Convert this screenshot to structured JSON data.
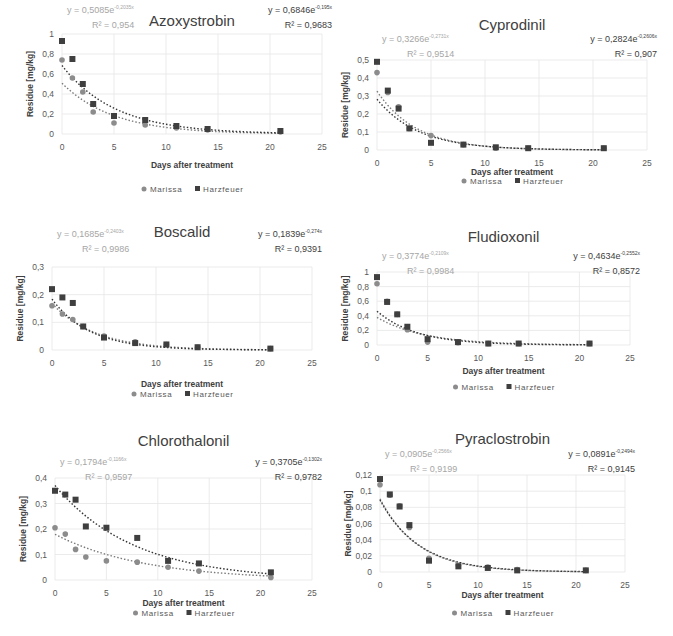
{
  "common": {
    "xlabel": "Days after treatment",
    "ylabel": "Residue [mg/kg]",
    "legend": [
      "Marissa",
      "Harzfeuer"
    ],
    "colors": {
      "Marissa": "#8c8c8c",
      "Harzfeuer": "#3f3f3f",
      "grid": "#e6e6e6",
      "text": "#404040",
      "eq_marissa": "#a6a6a6"
    }
  },
  "chart_data": [
    {
      "type": "scatter",
      "title": "Azoxystrobin",
      "xlabel": "Days after treatment",
      "ylabel": "Residue [mg/kg]",
      "xlim": [
        0,
        25
      ],
      "ylim": [
        0,
        1
      ],
      "xticks": [
        "0",
        "5",
        "10",
        "15",
        "20",
        "25"
      ],
      "yticks": [
        "0",
        "0,2",
        "0,4",
        "0,6",
        "0,8",
        "1"
      ],
      "x": [
        0,
        1,
        2,
        3,
        5,
        8,
        11,
        14,
        21
      ],
      "series": [
        {
          "name": "Marissa",
          "values": [
            0.74,
            0.56,
            0.42,
            0.22,
            0.11,
            0.09,
            0.06,
            0.04,
            0.02
          ],
          "fit": {
            "a": 0.5085,
            "b": 0.2035,
            "equation": "y = 0,5085e",
            "exponent": "-0,2035x",
            "r2": "R² = 0,954"
          }
        },
        {
          "name": "Harzfeuer",
          "values": [
            0.93,
            0.75,
            0.5,
            0.3,
            0.18,
            0.14,
            0.08,
            0.05,
            0.03
          ],
          "fit": {
            "a": 0.6846,
            "b": 0.195,
            "equation": "y = 0,6846e",
            "exponent": "-0,195x",
            "r2": "R² = 0,9683"
          }
        }
      ],
      "legend_position": "bottom",
      "grid": true
    },
    {
      "type": "scatter",
      "title": "Cyprodinil",
      "xlabel": "Days after treatment",
      "ylabel": "Residue [mg/kg]",
      "xlim": [
        0,
        25
      ],
      "ylim": [
        0,
        0.5
      ],
      "xticks": [
        "0",
        "5",
        "10",
        "15",
        "20",
        "25"
      ],
      "yticks": [
        "0",
        "0,1",
        "0,2",
        "0,3",
        "0,4",
        "0,5"
      ],
      "x": [
        0,
        1,
        2,
        3,
        5,
        8,
        11,
        14,
        21
      ],
      "series": [
        {
          "name": "Marissa",
          "values": [
            0.43,
            0.32,
            0.24,
            0.12,
            0.08,
            0.03,
            0.01,
            0.01,
            0.01
          ],
          "fit": {
            "a": 0.3266,
            "b": 0.2731,
            "equation": "y = 0,3266e",
            "exponent": "-0,2731x",
            "r2": "R² = 0,9514"
          }
        },
        {
          "name": "Harzfeuer",
          "values": [
            0.49,
            0.33,
            0.23,
            0.12,
            0.04,
            0.03,
            0.015,
            0.01,
            0.01
          ],
          "fit": {
            "a": 0.2824,
            "b": 0.2606,
            "equation": "y = 0,2824e",
            "exponent": "-0,2606x",
            "r2": "R² = 0,907"
          }
        }
      ],
      "legend_position": "bottom",
      "grid": true
    },
    {
      "type": "scatter",
      "title": "Boscalid",
      "xlabel": "Days after treatment",
      "ylabel": "Residue [mg/kg]",
      "xlim": [
        0,
        25
      ],
      "ylim": [
        0,
        0.3
      ],
      "xticks": [
        "0",
        "5",
        "10",
        "15",
        "20",
        "25"
      ],
      "yticks": [
        "0",
        "0,1",
        "0,2",
        "0,3"
      ],
      "x": [
        0,
        1,
        2,
        3,
        5,
        8,
        11,
        14,
        21
      ],
      "series": [
        {
          "name": "Marissa",
          "values": [
            0.16,
            0.13,
            0.11,
            0.085,
            0.05,
            0.03,
            0.02,
            0.01,
            0.005
          ],
          "fit": {
            "a": 0.1685,
            "b": 0.2403,
            "equation": "y = 0,1685e",
            "exponent": "-0,2403x",
            "r2": "R² = 0,9986"
          }
        },
        {
          "name": "Harzfeuer",
          "values": [
            0.22,
            0.19,
            0.17,
            0.085,
            0.045,
            0.025,
            0.02,
            0.01,
            0.005
          ],
          "fit": {
            "a": 0.1839,
            "b": 0.274,
            "equation": "y = 0,1839e",
            "exponent": "-0,274x",
            "r2": "R² = 0,9391"
          }
        }
      ],
      "legend_position": "bottom",
      "grid": true
    },
    {
      "type": "scatter",
      "title": "Fludioxonil",
      "xlabel": "Days after treatment",
      "ylabel": "Residue [mg/kg]",
      "xlim": [
        0,
        25
      ],
      "ylim": [
        0,
        1
      ],
      "xticks": [
        "0",
        "5",
        "10",
        "15",
        "20",
        "25"
      ],
      "yticks": [
        "0",
        "0,2",
        "0,4",
        "0,6",
        "0,8",
        "1"
      ],
      "x": [
        0,
        1,
        2,
        3,
        5,
        8,
        11,
        14,
        21
      ],
      "series": [
        {
          "name": "Marissa",
          "values": [
            0.84,
            0.6,
            0.42,
            0.21,
            0.04,
            0.03,
            0.02,
            0.02,
            0.02
          ],
          "fit": {
            "a": 0.3774,
            "b": 0.2109,
            "equation": "y = 0,3774e",
            "exponent": "-0,2109x",
            "r2": "R² = 0,9984"
          }
        },
        {
          "name": "Harzfeuer",
          "values": [
            0.93,
            0.59,
            0.42,
            0.25,
            0.08,
            0.04,
            0.02,
            0.02,
            0.02
          ],
          "fit": {
            "a": 0.4634,
            "b": 0.2552,
            "equation": "y = 0,4634e",
            "exponent": "-0,2552x",
            "r2": "R² = 0,8572"
          }
        }
      ],
      "legend_position": "bottom",
      "grid": true
    },
    {
      "type": "scatter",
      "title": "Chlorothalonil",
      "xlabel": "Days after treatment",
      "ylabel": "Residue [mg/kg]",
      "xlim": [
        0,
        25
      ],
      "ylim": [
        0,
        0.4
      ],
      "xticks": [
        "0",
        "5",
        "10",
        "15",
        "20",
        "25"
      ],
      "yticks": [
        "0",
        "0,1",
        "0,2",
        "0,3",
        "0,4"
      ],
      "x": [
        0,
        1,
        2,
        3,
        5,
        8,
        11,
        14,
        21
      ],
      "series": [
        {
          "name": "Marissa",
          "values": [
            0.205,
            0.18,
            0.12,
            0.09,
            0.075,
            0.07,
            0.05,
            0.035,
            0.01
          ],
          "fit": {
            "a": 0.1794,
            "b": 0.1166,
            "equation": "y = 0,1794e",
            "exponent": "-0,1166x",
            "r2": "R² = 0,9597"
          }
        },
        {
          "name": "Harzfeuer",
          "values": [
            0.35,
            0.335,
            0.315,
            0.21,
            0.205,
            0.165,
            0.075,
            0.065,
            0.03
          ],
          "fit": {
            "a": 0.3705,
            "b": 0.1302,
            "equation": "y = 0,3705e",
            "exponent": "-0,1302x",
            "r2": "R² = 0,9782"
          }
        }
      ],
      "legend_position": "bottom",
      "grid": true
    },
    {
      "type": "scatter",
      "title": "Pyraclostrobin",
      "xlabel": "Days after treatment",
      "ylabel": "Residue [mg/kg]",
      "xlim": [
        0,
        25
      ],
      "ylim": [
        0,
        0.12
      ],
      "xticks": [
        "0",
        "5",
        "10",
        "15",
        "20",
        "25"
      ],
      "yticks": [
        "0",
        "0,02",
        "0,04",
        "0,06",
        "0,08",
        "0,1",
        "0,12"
      ],
      "x": [
        0,
        1,
        2,
        3,
        5,
        8,
        11,
        14,
        21
      ],
      "series": [
        {
          "name": "Marissa",
          "values": [
            0.108,
            0.095,
            0.082,
            0.055,
            0.017,
            0.008,
            0.006,
            0.003,
            0.002
          ],
          "fit": {
            "a": 0.0905,
            "b": 0.2566,
            "equation": "y = 0,0905e",
            "exponent": "-0,2566x",
            "r2": "R² = 0,9199"
          }
        },
        {
          "name": "Harzfeuer",
          "values": [
            0.115,
            0.096,
            0.081,
            0.058,
            0.014,
            0.007,
            0.005,
            0.002,
            0.002
          ],
          "fit": {
            "a": 0.0891,
            "b": 0.2494,
            "equation": "y = 0,0891e",
            "exponent": "-0,2494x",
            "r2": "R² = 0,9145"
          }
        }
      ],
      "legend_position": "bottom",
      "grid": true
    }
  ]
}
